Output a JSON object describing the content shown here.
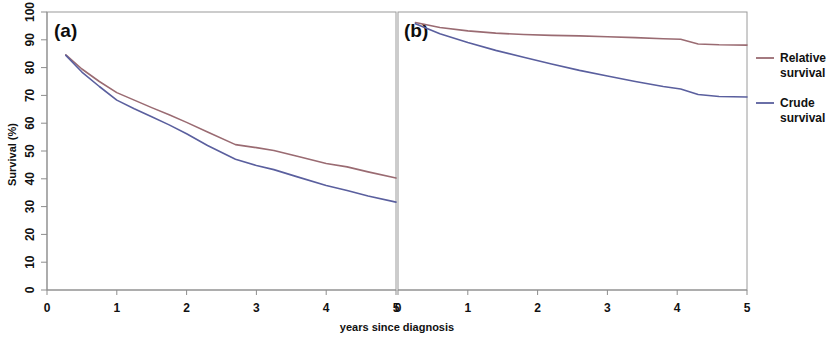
{
  "figure": {
    "xlabel": "years since diagnosis",
    "ylabel": "Survival (%)",
    "panels": [
      {
        "label": "(a)"
      },
      {
        "label": "(b)"
      }
    ]
  },
  "legend": {
    "position": "right",
    "entries": [
      {
        "name": "relative-survival",
        "line1": "Relative",
        "line2": "survival",
        "color": "#9a6b72"
      },
      {
        "name": "crude-survival",
        "line1": "Crude",
        "line2": "survival",
        "color": "#5a5f9e"
      }
    ]
  },
  "axis": {
    "x_ticks": [
      "0",
      "1",
      "2",
      "3",
      "4",
      "5"
    ],
    "y_ticks": [
      "0",
      "10",
      "20",
      "30",
      "40",
      "50",
      "60",
      "70",
      "80",
      "90",
      "100"
    ],
    "xlim": [
      0,
      5
    ],
    "ylim": [
      0,
      100
    ]
  },
  "chart_data": [
    {
      "type": "line",
      "panel": "(a)",
      "title": "",
      "xlabel": "years since diagnosis",
      "ylabel": "Survival (%)",
      "xlim": [
        0,
        5
      ],
      "ylim": [
        0,
        100
      ],
      "x_ticks": [
        0,
        1,
        2,
        3,
        4,
        5
      ],
      "y_ticks": [
        0,
        10,
        20,
        30,
        40,
        50,
        60,
        70,
        80,
        90,
        100
      ],
      "grid": false,
      "legend_position": "right",
      "x": [
        0.27,
        0.5,
        0.75,
        1.0,
        1.25,
        1.5,
        1.75,
        2.0,
        2.3,
        2.7,
        3.0,
        3.25,
        3.6,
        4.0,
        4.3,
        4.6,
        5.0
      ],
      "series": [
        {
          "name": "Relative survival",
          "color": "#9a6b72",
          "values": [
            84.6,
            79.5,
            75.0,
            71.0,
            68.3,
            65.6,
            63.0,
            60.3,
            56.8,
            52.3,
            51.2,
            50.2,
            48.0,
            45.5,
            44.3,
            42.5,
            40.3
          ]
        },
        {
          "name": "Crude survival",
          "color": "#5a5f9e",
          "values": [
            84.4,
            78.4,
            73.2,
            68.3,
            65.2,
            62.3,
            59.4,
            56.2,
            52.0,
            47.0,
            44.8,
            43.3,
            40.6,
            37.6,
            35.8,
            33.8,
            31.6
          ]
        }
      ]
    },
    {
      "type": "line",
      "panel": "(b)",
      "title": "",
      "xlabel": "years since diagnosis",
      "ylabel": "Survival (%)",
      "xlim": [
        0,
        5
      ],
      "ylim": [
        0,
        100
      ],
      "x_ticks": [
        0,
        1,
        2,
        3,
        4,
        5
      ],
      "y_ticks": [
        0,
        10,
        20,
        30,
        40,
        50,
        60,
        70,
        80,
        90,
        100
      ],
      "grid": false,
      "legend_position": "right",
      "x": [
        0.25,
        0.6,
        1.0,
        1.4,
        1.8,
        2.2,
        2.6,
        3.0,
        3.4,
        3.8,
        4.05,
        4.3,
        4.6,
        5.0
      ],
      "series": [
        {
          "name": "Relative survival",
          "color": "#9a6b72",
          "values": [
            96.2,
            94.4,
            93.2,
            92.4,
            91.9,
            91.6,
            91.4,
            91.1,
            90.8,
            90.4,
            90.2,
            88.5,
            88.2,
            88.1
          ]
        },
        {
          "name": "Crude survival",
          "color": "#5a5f9e",
          "values": [
            95.8,
            92.2,
            89.0,
            86.2,
            83.7,
            81.3,
            79.0,
            77.0,
            75.0,
            73.2,
            72.3,
            70.3,
            69.6,
            69.4
          ]
        }
      ]
    }
  ]
}
